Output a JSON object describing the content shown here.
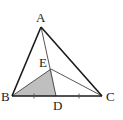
{
  "figure": {
    "type": "triangle-geometry",
    "points": {
      "A": {
        "label": "A",
        "x": 41,
        "y": 27,
        "lx": 36,
        "ly": 22
      },
      "B": {
        "label": "B",
        "x": 12,
        "y": 96,
        "lx": 1,
        "ly": 101
      },
      "C": {
        "label": "C",
        "x": 102,
        "y": 96,
        "lx": 106,
        "ly": 101
      },
      "D": {
        "label": "D",
        "x": 56,
        "y": 96,
        "lx": 53,
        "ly": 110
      },
      "E": {
        "label": "E",
        "x": 51,
        "y": 69,
        "lx": 39,
        "ly": 67
      }
    },
    "segments": [
      {
        "from": "A",
        "to": "B",
        "style": "thick"
      },
      {
        "from": "A",
        "to": "C",
        "style": "thick"
      },
      {
        "from": "B",
        "to": "C",
        "style": "thick"
      },
      {
        "from": "A",
        "to": "D",
        "style": "thin"
      },
      {
        "from": "E",
        "to": "C",
        "style": "thin"
      }
    ],
    "shaded_region": {
      "vertices": [
        "B",
        "E",
        "D"
      ],
      "color": "#bfbfbf"
    },
    "equal_marks": [
      {
        "segment": "BD",
        "x": 34,
        "y": 96
      },
      {
        "segment": "DC",
        "x": 79,
        "y": 96
      }
    ],
    "colors": {
      "stroke": "#1a1a1a",
      "thin_stroke": "#444444",
      "fill": "#bfbfbf"
    }
  }
}
